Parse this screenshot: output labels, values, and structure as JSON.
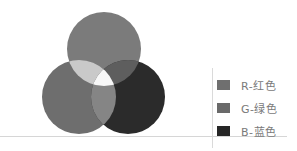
{
  "legend": {
    "items": [
      {
        "label": "R-红色",
        "color": "#6f6f6f"
      },
      {
        "label": "G-绿色",
        "color": "#6a6a6a"
      },
      {
        "label": "B-蓝色",
        "color": "#262626"
      }
    ]
  },
  "venn": {
    "sets": [
      {
        "name": "R",
        "color": "#7b7b7b"
      },
      {
        "name": "G",
        "color": "#6e6e6e"
      },
      {
        "name": "B",
        "color": "#2b2b2b"
      }
    ],
    "overlaps": {
      "R_G": "#c9c9c9",
      "R_B": "#5e5e5e",
      "G_B": "#858585",
      "R_G_B": "#f7f7f7"
    }
  }
}
